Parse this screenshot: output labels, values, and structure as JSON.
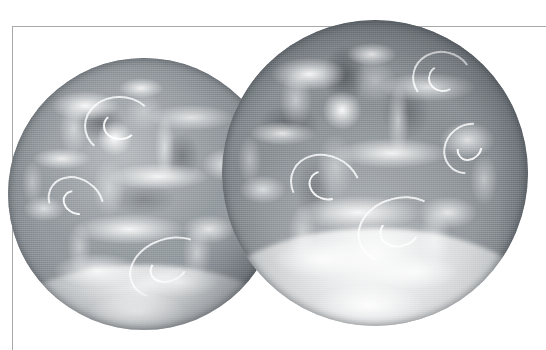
{
  "figure": {
    "kind": "scanned-halftone-photograph",
    "title": "",
    "caption": "",
    "background_color": "#ffffff",
    "rule_color": "#a8a8a8",
    "width": 546,
    "height": 350
  },
  "frame": {
    "top_rule_label": "figure-top-rule",
    "left_rule_label": "figure-left-rule"
  },
  "globes": [
    {
      "id": "globe-left",
      "label": "earth-disc-left",
      "alt_text": "Grayscale satellite full-disc view of Earth, partially hidden behind the second disc",
      "ocean_tone": "#92989d",
      "cloud_tone": "#ffffff",
      "limb_shadow_tone": "#4a5055",
      "center_x": 144,
      "center_y": 194,
      "radius": 136,
      "features": [
        "bright cloud swirl upper-centre",
        "banded mid-latitude cloud streets",
        "bright southern cloud mass lower-centre"
      ]
    },
    {
      "id": "globe-right",
      "label": "earth-disc-right",
      "alt_text": "Grayscale satellite full-disc view of Earth overlapping and in front of the first disc",
      "ocean_tone": "#888e93",
      "cloud_tone": "#ffffff",
      "limb_shadow_tone": "#454b50",
      "center_x": 375,
      "center_y": 173,
      "radius": 153,
      "features": [
        "dark continental mass upper-left of disc",
        "spiral cyclone near upper-right limb",
        "second spiral cyclone mid-right",
        "broad bright frontal cloud band across centre",
        "very bright southern polar cloud/ice cap"
      ]
    }
  ]
}
